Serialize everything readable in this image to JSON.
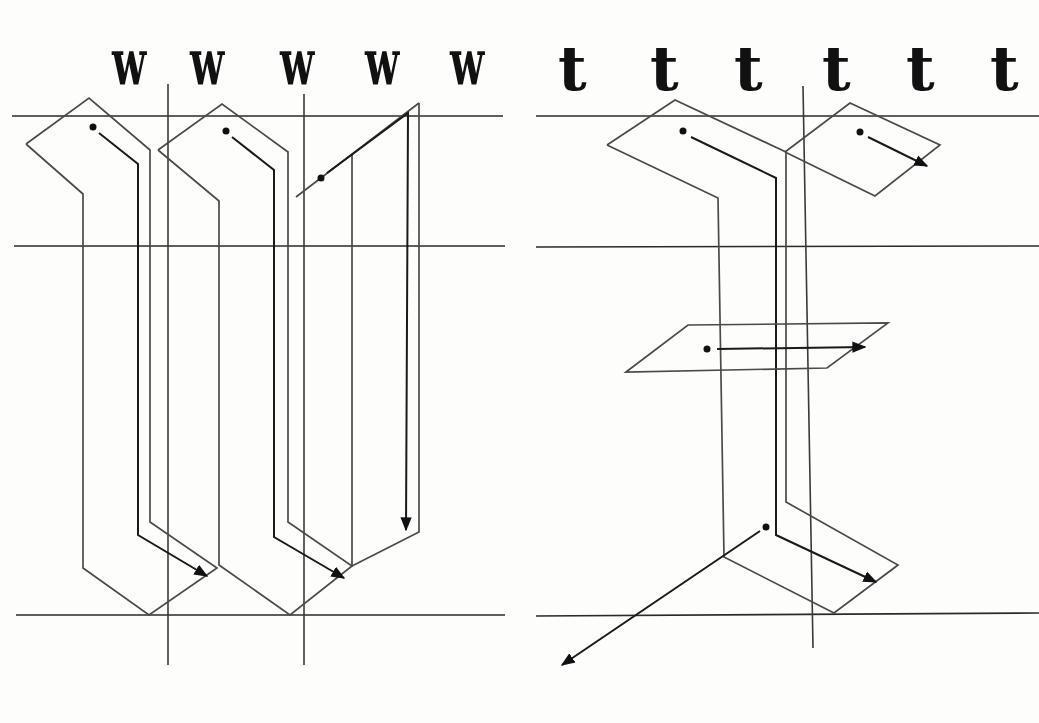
{
  "panels": [
    {
      "id": "left",
      "letter": "w",
      "examples": [
        {
          "char": "w",
          "x": 112
        },
        {
          "char": "w",
          "x": 190
        },
        {
          "char": "w",
          "x": 280
        },
        {
          "char": "w",
          "x": 365
        },
        {
          "char": "w",
          "x": 450
        }
      ]
    },
    {
      "id": "right",
      "letter": "t",
      "examples": [
        {
          "char": "t",
          "x": 560
        },
        {
          "char": "t",
          "x": 650
        },
        {
          "char": "t",
          "x": 735
        },
        {
          "char": "t",
          "x": 822
        },
        {
          "char": "t",
          "x": 908
        },
        {
          "char": "t",
          "x": 990
        }
      ]
    }
  ],
  "guidelines": {
    "ascender_y": 116,
    "xheight_y": 246,
    "baseline_y": 615
  },
  "colors": {
    "ink": "#111111",
    "outline": "#4a4a4a",
    "paper": "#fdfdfc"
  }
}
